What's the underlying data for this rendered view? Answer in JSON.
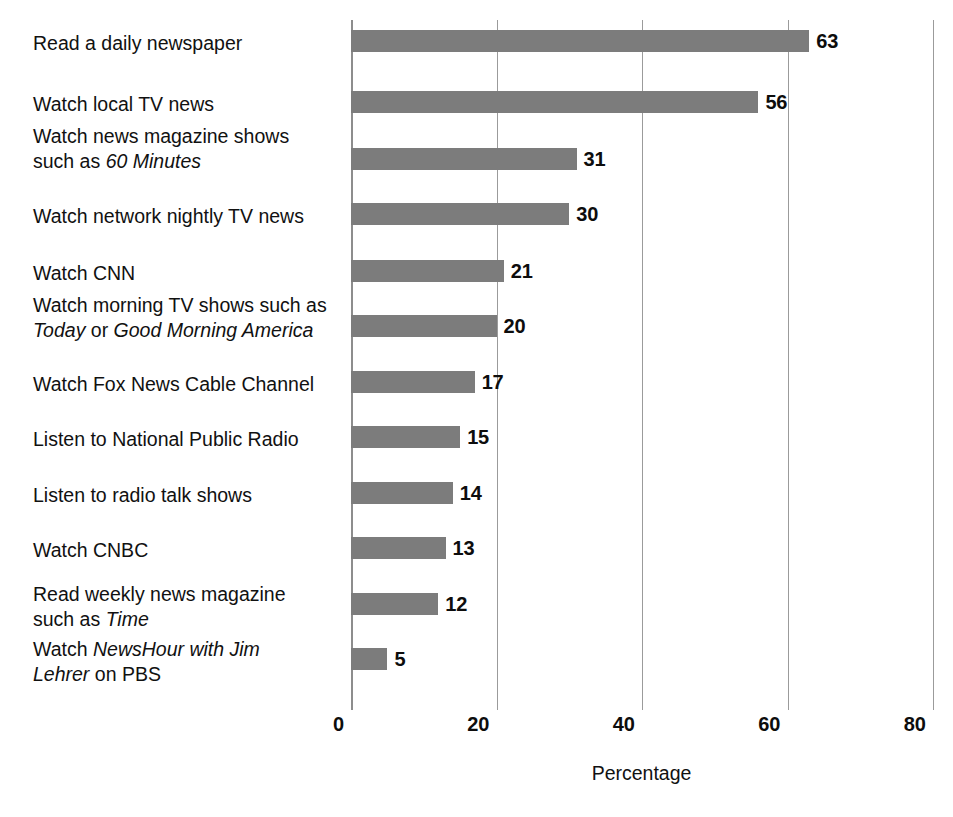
{
  "chart_data": {
    "type": "bar",
    "orientation": "horizontal",
    "title": "",
    "xlabel": "Percentage",
    "ylabel": "",
    "xlim": [
      0,
      80
    ],
    "xticks": [
      0,
      20,
      40,
      60,
      80
    ],
    "xtick_labels": [
      "0",
      "20",
      "40",
      "60",
      "80"
    ],
    "grid": true,
    "legend": false,
    "bar_color": "#7c7c7c",
    "value_labels": true,
    "categories": [
      "Read a daily newspaper",
      "Watch news magazine shows such as 60 Minutes",
      "Watch local TV news",
      "Watch network nightly TV news",
      "Watch CNN",
      "Watch morning TV shows such as Today or Good Morning America",
      "Watch Fox News Cable Channel",
      "Listen to National Public Radio",
      "Listen to radio talk shows",
      "Watch CNBC",
      "Read weekly news magazine such as Time",
      "Watch NewsHour with Jim Lehrer on PBS"
    ],
    "values": [
      63,
      56,
      31,
      30,
      21,
      20,
      17,
      15,
      14,
      13,
      12,
      5
    ]
  },
  "rows": [
    {
      "value": 63,
      "value_label": "63",
      "label_lines": [
        [
          {
            "text": "Read a daily newspaper",
            "italic": false
          }
        ]
      ]
    },
    {
      "value": 56,
      "value_label": "56",
      "label_lines": [
        [
          {
            "text": "Watch local TV news",
            "italic": false
          }
        ]
      ]
    },
    {
      "value": 31,
      "value_label": "31",
      "label_lines": [
        [
          {
            "text": "Watch news magazine shows",
            "italic": false
          }
        ],
        [
          {
            "text": "such as ",
            "italic": false
          },
          {
            "text": "60 Minutes",
            "italic": true
          }
        ]
      ]
    },
    {
      "value": 30,
      "value_label": "30",
      "label_lines": [
        [
          {
            "text": "Watch network nightly TV news",
            "italic": false
          }
        ]
      ]
    },
    {
      "value": 21,
      "value_label": "21",
      "label_lines": [
        [
          {
            "text": "Watch CNN",
            "italic": false
          }
        ]
      ]
    },
    {
      "value": 20,
      "value_label": "20",
      "label_lines": [
        [
          {
            "text": "Watch morning TV shows such as",
            "italic": false
          }
        ],
        [
          {
            "text": "Today",
            "italic": true
          },
          {
            "text": " or ",
            "italic": false
          },
          {
            "text": "Good Morning America",
            "italic": true
          }
        ]
      ]
    },
    {
      "value": 17,
      "value_label": "17",
      "label_lines": [
        [
          {
            "text": "Watch Fox News Cable Channel",
            "italic": false
          }
        ]
      ]
    },
    {
      "value": 15,
      "value_label": "15",
      "label_lines": [
        [
          {
            "text": "Listen to National Public Radio",
            "italic": false
          }
        ]
      ]
    },
    {
      "value": 14,
      "value_label": "14",
      "label_lines": [
        [
          {
            "text": "Listen to radio talk shows",
            "italic": false
          }
        ]
      ]
    },
    {
      "value": 13,
      "value_label": "13",
      "label_lines": [
        [
          {
            "text": "Watch CNBC",
            "italic": false
          }
        ]
      ]
    },
    {
      "value": 12,
      "value_label": "12",
      "label_lines": [
        [
          {
            "text": "Read weekly news magazine",
            "italic": false
          }
        ],
        [
          {
            "text": "such as ",
            "italic": false
          },
          {
            "text": "Time",
            "italic": true
          }
        ]
      ]
    },
    {
      "value": 5,
      "value_label": "5",
      "label_lines": [
        [
          {
            "text": "Watch ",
            "italic": false
          },
          {
            "text": "NewsHour with Jim",
            "italic": true
          }
        ],
        [
          {
            "text": "Lehrer",
            "italic": true
          },
          {
            "text": " on PBS",
            "italic": false
          }
        ]
      ]
    }
  ],
  "axis": {
    "title": "Percentage",
    "ticks": [
      {
        "value": 0,
        "label": "0"
      },
      {
        "value": 20,
        "label": "20"
      },
      {
        "value": 40,
        "label": "40"
      },
      {
        "value": 60,
        "label": "60"
      },
      {
        "value": 80,
        "label": "80"
      }
    ]
  },
  "geometry": {
    "bar_height": 22,
    "row_tops": [
      30,
      91,
      148,
      203,
      260,
      315,
      371,
      426,
      482,
      537,
      593,
      648
    ],
    "label_tops": [
      31,
      92,
      124,
      204,
      261,
      293,
      372,
      427,
      483,
      538,
      582,
      637
    ]
  },
  "style": {
    "bar_color": "#7c7c7c",
    "grid_color": "#9b9b9b",
    "text_color": "#111111",
    "background": "#ffffff"
  }
}
